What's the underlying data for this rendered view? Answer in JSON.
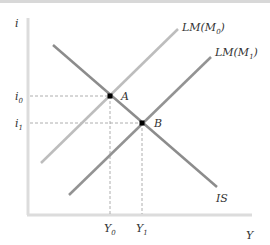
{
  "figure": {
    "type": "IS-LM diagram",
    "axes": {
      "y_label": "i",
      "x_label": "Y"
    },
    "curves": [
      {
        "name": "LM(M0)",
        "label": "LM(M",
        "sub": "0",
        "close": ")",
        "color": "#b8b8b8"
      },
      {
        "name": "LM(M1)",
        "label": "LM(M",
        "sub": "1",
        "close": ")",
        "color": "#8f8f8f"
      },
      {
        "name": "IS",
        "label": "IS",
        "color": "#8a8a8a"
      }
    ],
    "points": [
      {
        "name": "A",
        "label": "A"
      },
      {
        "name": "B",
        "label": "B"
      }
    ],
    "y_ticks": [
      {
        "label": "i",
        "sub": "0"
      },
      {
        "label": "i",
        "sub": "1"
      }
    ],
    "x_ticks": [
      {
        "label": "Y",
        "sub": "0"
      },
      {
        "label": "Y",
        "sub": "1"
      }
    ]
  }
}
